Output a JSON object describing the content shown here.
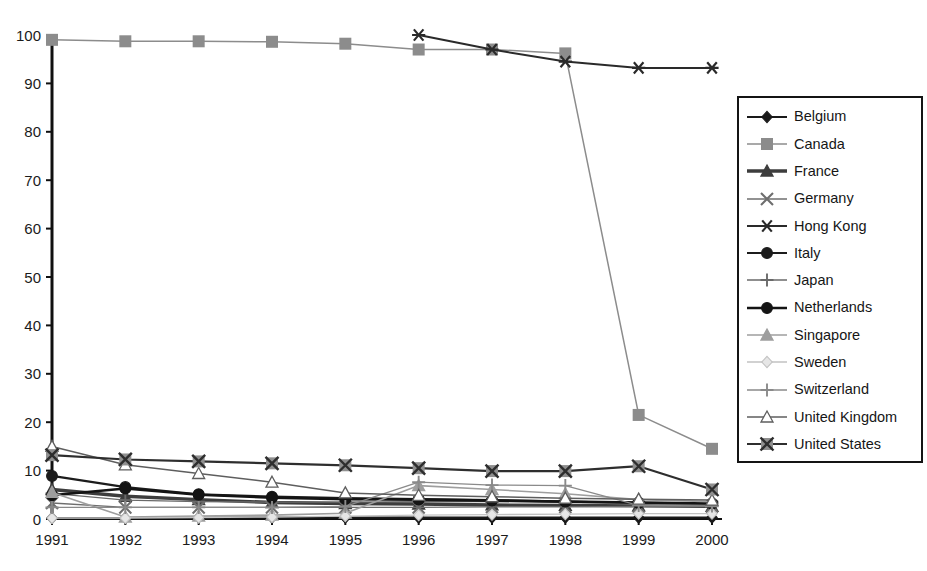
{
  "chart_data": {
    "type": "line",
    "title": "",
    "subtitle": "",
    "xlabel": "",
    "ylabel": "",
    "categories": [
      "1991",
      "1992",
      "1993",
      "1994",
      "1995",
      "1996",
      "1997",
      "1998",
      "1999",
      "2000"
    ],
    "x_tick_labels": [
      "1991",
      "1992",
      "1993",
      "1994",
      "1995",
      "1996",
      "1997",
      "1998",
      "1999",
      "2000"
    ],
    "y_tick_labels": [
      "0",
      "10",
      "20",
      "30",
      "40",
      "50",
      "60",
      "70",
      "80",
      "90",
      "100"
    ],
    "y_ticks": [
      0,
      10,
      20,
      30,
      40,
      50,
      60,
      70,
      80,
      90,
      100
    ],
    "ylim": [
      0,
      100
    ],
    "grid": false,
    "legend_position": "right",
    "series": [
      {
        "name": "Belgium",
        "marker": "diamond",
        "color": "#1a1a1a",
        "line_width": 1.9,
        "marker_fill": "#1a1a1a",
        "values": [
          0.2,
          0.2,
          0.3,
          0.3,
          0.3,
          0.3,
          0.3,
          0.3,
          0.3,
          0.3
        ]
      },
      {
        "name": "Canada",
        "marker": "square",
        "color": "#8c8c8c",
        "line_width": 1.5,
        "marker_fill": "#8c8c8c",
        "values": [
          99.0,
          98.7,
          98.7,
          98.6,
          98.2,
          97.0,
          97.0,
          96.2,
          21.5,
          14.5
        ]
      },
      {
        "name": "France",
        "marker": "triangle",
        "color": "#3d3d3d",
        "line_width": 3.4,
        "marker_fill": "#3d3d3d",
        "values": [
          6.1,
          4.7,
          4.0,
          3.4,
          3.2,
          3.1,
          2.9,
          2.8,
          2.7,
          2.6
        ]
      },
      {
        "name": "Germany",
        "marker": "x",
        "color": "#6e6e6e",
        "line_width": 1.4,
        "marker_fill": "none",
        "values": [
          3.3,
          2.4,
          2.4,
          2.4,
          2.4,
          2.4,
          2.5,
          2.5,
          2.6,
          2.6
        ]
      },
      {
        "name": "Hong Kong",
        "marker": "asterisk",
        "color": "#2a2a2a",
        "line_width": 2.0,
        "marker_fill": "#2a2a2a",
        "values": [
          null,
          null,
          null,
          null,
          null,
          100.0,
          97.0,
          94.5,
          93.2,
          93.2
        ]
      },
      {
        "name": "Italy",
        "marker": "circle",
        "color": "#1c1c1c",
        "line_width": 2.2,
        "marker_fill": "#1c1c1c",
        "values": [
          8.9,
          6.6,
          5.1,
          4.6,
          4.3,
          4.1,
          3.9,
          3.6,
          3.3,
          3.2
        ]
      },
      {
        "name": "Japan",
        "marker": "plus",
        "color": "#6a6a6a",
        "line_width": 1.3,
        "marker_fill": "none",
        "values": [
          5.3,
          3.9,
          3.6,
          3.5,
          3.5,
          3.6,
          3.6,
          3.5,
          3.4,
          3.3
        ]
      },
      {
        "name": "Netherlands",
        "marker": "circle",
        "color": "#141414",
        "line_width": 2.6,
        "marker_fill": "#141414",
        "values": [
          4.9,
          6.3,
          5.0,
          4.4,
          4.1,
          4.0,
          3.8,
          3.6,
          3.4,
          3.2
        ]
      },
      {
        "name": "Singapore",
        "marker": "triangle",
        "color": "#9e9e9e",
        "line_width": 1.6,
        "marker_fill": "#9e9e9e",
        "values": [
          5.5,
          0.4,
          0.6,
          0.8,
          1.2,
          6.9,
          6.1,
          5.2,
          4.0,
          3.6
        ]
      },
      {
        "name": "Sweden",
        "marker": "diamond",
        "color": "#c2c2c2",
        "line_width": 1.3,
        "marker_fill": "#e6e6e6",
        "values": [
          0.2,
          0.2,
          0.3,
          0.4,
          0.6,
          0.8,
          0.9,
          1.0,
          1.1,
          1.1
        ]
      },
      {
        "name": "Switzerland",
        "marker": "plus",
        "color": "#8a8a8a",
        "line_width": 1.3,
        "marker_fill": "none",
        "values": [
          2.4,
          2.4,
          2.4,
          2.4,
          2.6,
          7.6,
          7.0,
          6.9,
          2.8,
          2.7
        ]
      },
      {
        "name": "United Kingdom",
        "marker": "triangle-open",
        "color": "#5e5e5e",
        "line_width": 1.5,
        "marker_fill": "#ffffff",
        "values": [
          15.0,
          11.2,
          9.4,
          7.6,
          5.4,
          4.9,
          4.6,
          4.3,
          4.1,
          3.9
        ]
      },
      {
        "name": "United States",
        "marker": "square-x",
        "color": "#2e2e2e",
        "line_width": 2.2,
        "marker_fill": "#8f8f8f",
        "values": [
          13.2,
          12.3,
          11.9,
          11.5,
          11.1,
          10.5,
          9.9,
          9.9,
          10.9,
          6.1
        ]
      }
    ]
  },
  "legend": {
    "items": [
      {
        "label": "Belgium"
      },
      {
        "label": "Canada"
      },
      {
        "label": "France"
      },
      {
        "label": "Germany"
      },
      {
        "label": "Hong Kong"
      },
      {
        "label": "Italy"
      },
      {
        "label": "Japan"
      },
      {
        "label": "Netherlands"
      },
      {
        "label": "Singapore"
      },
      {
        "label": "Sweden"
      },
      {
        "label": "Switzerland"
      },
      {
        "label": "United Kingdom"
      },
      {
        "label": "United States"
      }
    ]
  },
  "colors": {
    "background": "#ffffff",
    "axis": "#101010",
    "text": "#1a1a1a",
    "legend_border": "#141414"
  }
}
